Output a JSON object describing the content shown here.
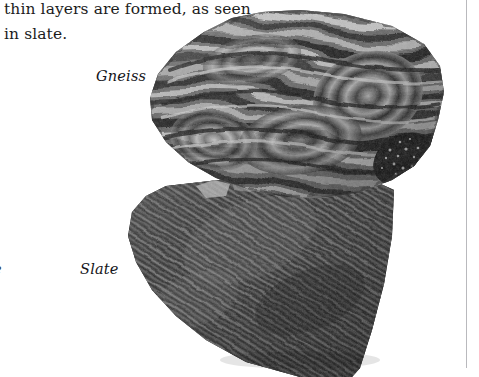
{
  "page": {
    "background_color": "#ffffff",
    "width": 479,
    "height": 377
  },
  "body_text": {
    "content": "thin layers are formed, as seen\nin slate.",
    "lines": [
      "thin layers are formed, as seen",
      "in slate."
    ],
    "color": "#1c1c1c"
  },
  "figure": {
    "caption_labels": [
      {
        "label": "Gneiss",
        "style": "italic"
      },
      {
        "label": "Slate",
        "style": "italic"
      }
    ],
    "clipped_label_fragment": "e",
    "specimens": [
      {
        "name": "Gneiss",
        "description": "Coarse metamorphic rock with contorted alternating light and dark mineral bands (gneissic banding).",
        "tone_light": "#d2d2d2",
        "tone_mid": "#7e7e7e",
        "tone_dark": "#1b1b1b"
      },
      {
        "name": "Slate",
        "description": "Fine-grained metamorphic rock showing closely spaced parallel slaty cleavage striations.",
        "tone_light": "#8e8e8e",
        "tone_mid": "#4a4a4a",
        "tone_dark": "#202020"
      }
    ]
  },
  "rules": {
    "vertical_rule_color": "#b9b9bd"
  }
}
